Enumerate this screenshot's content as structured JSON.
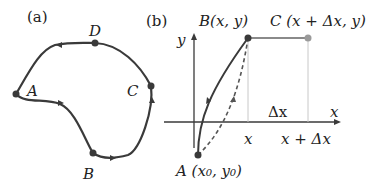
{
  "panel_a": {
    "label": "(a)",
    "points": [
      {
        "name": "A",
        "x": 16,
        "y": 94
      },
      {
        "name": "B",
        "x": 93,
        "y": 153
      },
      {
        "name": "C",
        "x": 151,
        "y": 86
      },
      {
        "name": "D",
        "x": 95,
        "y": 43
      }
    ]
  },
  "panel_b": {
    "label": "(b)",
    "axis_x_label": "x",
    "axis_y_label": "y",
    "point_B_label": "B(x, y)",
    "point_C_label": "C (x + Δx, y)",
    "point_A_label": "A (x₀, y₀)",
    "tick_x": "x",
    "tick_x_dx": "x + Δx",
    "delta_label": "Δx"
  },
  "colors": {
    "curve": "#3a3a3a",
    "light_point": "#9a9a9a",
    "guide": "#c8c8c8"
  }
}
